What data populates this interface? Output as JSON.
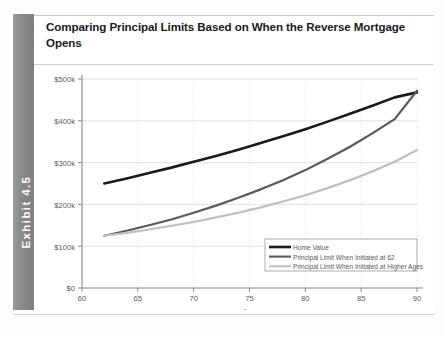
{
  "exhibit": {
    "label": "Exhibit 4.5"
  },
  "chart_title": "Comparing Principal Limits Based on When the Reverse Mortgage Opens",
  "colors": {
    "home_value": "#1a1a1a",
    "principal_62": "#595959",
    "principal_higher": "#bfbfbf",
    "grid": "#d8d8d8",
    "axis": "#8a8a8a",
    "tab_background": "#8f8f8f",
    "text": "#1b1b1b"
  },
  "chart_data": {
    "type": "line",
    "title": "Comparing Principal Limits Based on When the Reverse Mortgage Opens",
    "xlabel": "Age",
    "ylabel": "",
    "xlim": [
      60,
      90
    ],
    "ylim": [
      0,
      500000
    ],
    "grid": true,
    "legend_position": "bottom-right",
    "x_ticks": [
      60,
      65,
      70,
      75,
      80,
      85,
      90
    ],
    "x_tick_labels": [
      "60",
      "65",
      "70",
      "75",
      "80",
      "85",
      "90"
    ],
    "y_ticks": [
      0,
      100000,
      200000,
      300000,
      400000,
      500000
    ],
    "y_tick_labels": [
      "$0",
      "$100k",
      "$200k",
      "$300k",
      "$400k",
      "$500k"
    ],
    "x": [
      62,
      64,
      66,
      68,
      70,
      72,
      74,
      76,
      78,
      80,
      82,
      84,
      86,
      88,
      90
    ],
    "series": [
      {
        "name": "Home Value",
        "color": "#1a1a1a",
        "width": 2.6,
        "values": [
          250000,
          262000,
          275000,
          288000,
          302000,
          316000,
          331000,
          347000,
          363000,
          380000,
          398000,
          417000,
          436000,
          456000,
          468000
        ]
      },
      {
        "name": "Principal Limit When Initiated at 62",
        "color": "#595959",
        "width": 2.2,
        "values": [
          125000,
          137000,
          150000,
          164000,
          180000,
          197000,
          216000,
          236000,
          258000,
          282000,
          309000,
          338000,
          370000,
          404000,
          472000
        ]
      },
      {
        "name": "Principal Limit When Initiated at Higher Ages",
        "color": "#bfbfbf",
        "width": 2.2,
        "values": [
          125000,
          132000,
          140000,
          149000,
          158000,
          169000,
          180000,
          193000,
          207000,
          222000,
          239000,
          258000,
          279000,
          302000,
          330000
        ]
      }
    ]
  },
  "legend": {
    "items": [
      {
        "label": "Home Value",
        "color": "#1a1a1a"
      },
      {
        "label": "Principal Limit When Initiated at 62",
        "color": "#595959"
      },
      {
        "label": "Principal Limit When Initiated at Higher Ages",
        "color": "#bfbfbf"
      }
    ]
  }
}
